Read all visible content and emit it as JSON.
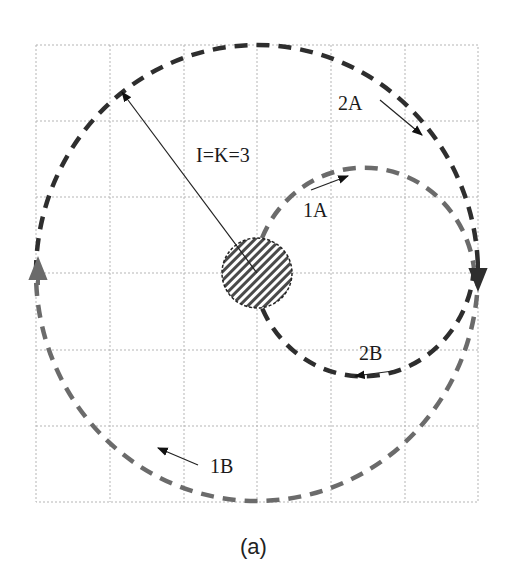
{
  "figure": {
    "caption": "(a)",
    "radius_label": "I=K=3",
    "grid": {
      "columns": 6,
      "rows": 6,
      "style": "dotted"
    },
    "colors": {
      "dark_path": "#2e2e2e",
      "gray_path": "#6b6b6b",
      "grid": "#b5b5b5",
      "hub_fill": "#4a4a4a"
    },
    "paths": [
      {
        "id": "1A",
        "label": "1A",
        "shade": "gray",
        "description": "inner upper semicircle from hub to right edge"
      },
      {
        "id": "2A",
        "label": "2A",
        "shade": "dark",
        "description": "outer upper-right arc moving clockwise"
      },
      {
        "id": "2B",
        "label": "2B",
        "shade": "dark",
        "description": "inner lower semicircle returning to hub"
      },
      {
        "id": "1B",
        "label": "1B",
        "shade": "gray",
        "description": "outer lower arc moving counter-clockwise"
      }
    ],
    "hub": {
      "pattern": "diagonal hatch"
    }
  }
}
